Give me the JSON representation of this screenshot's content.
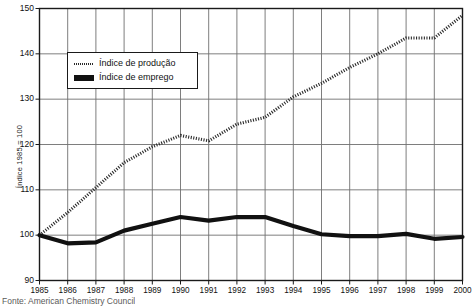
{
  "chart_data": {
    "type": "line",
    "title": "",
    "xlabel": "",
    "ylabel": "Índice 1985 = 100",
    "x": [
      1985,
      1986,
      1987,
      1988,
      1989,
      1990,
      1991,
      1992,
      1993,
      1994,
      1995,
      1996,
      1997,
      1998,
      1999,
      2000
    ],
    "categories": [
      "1985",
      "1986",
      "1987",
      "1988",
      "1989",
      "1990",
      "1991",
      "1992",
      "1993",
      "1994",
      "1995",
      "1996",
      "1997",
      "1998",
      "1999",
      "2000"
    ],
    "xlim": [
      1985,
      2000
    ],
    "ylim": [
      90,
      150
    ],
    "yticks": [
      90,
      100,
      110,
      120,
      130,
      140,
      150
    ],
    "ytick_labels": [
      "90",
      "100",
      "110",
      "120",
      "130",
      "140",
      "150"
    ],
    "grid": true,
    "legend_position": "upper-left-inside",
    "series": [
      {
        "name": "Índice de produção",
        "style": "dotted",
        "color": "#2b2b2b",
        "values": [
          100.0,
          105.0,
          110.5,
          116.0,
          119.5,
          122.0,
          120.8,
          124.5,
          126.0,
          130.5,
          133.5,
          137.0,
          140.0,
          143.5,
          143.5,
          148.5
        ]
      },
      {
        "name": "Índice de emprego",
        "style": "solid-thick",
        "color": "#111111",
        "values": [
          100.0,
          98.2,
          98.4,
          101.0,
          102.5,
          104.0,
          103.2,
          104.0,
          104.0,
          102.0,
          100.2,
          99.8,
          99.8,
          100.3,
          99.2,
          99.6
        ]
      }
    ]
  },
  "legend": {
    "items": [
      {
        "label": "Índice de produção",
        "swatch": "dotted-line-swatch"
      },
      {
        "label": "Índice de emprego",
        "swatch": "solid-line-swatch"
      }
    ]
  },
  "axes": {
    "y_title": "Índice 1985 = 100"
  },
  "footer": {
    "source": "Fonte: American Chemistry Council"
  },
  "colors": {
    "frame": "#1a1a1a",
    "grid": "#6f6f6f",
    "production_line": "#2b2b2b",
    "employment_line": "#111111",
    "background": "#ffffff"
  }
}
